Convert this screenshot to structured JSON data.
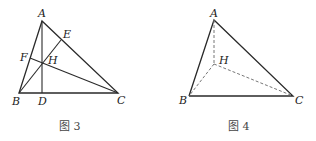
{
  "figures": [
    {
      "caption": "图 3",
      "labels": {
        "A": "A",
        "B": "B",
        "C": "C",
        "D": "D",
        "E": "E",
        "F": "F",
        "H": "H"
      }
    },
    {
      "caption": "图 4",
      "labels": {
        "A": "A",
        "B": "B",
        "C": "C",
        "H": "H"
      }
    }
  ]
}
